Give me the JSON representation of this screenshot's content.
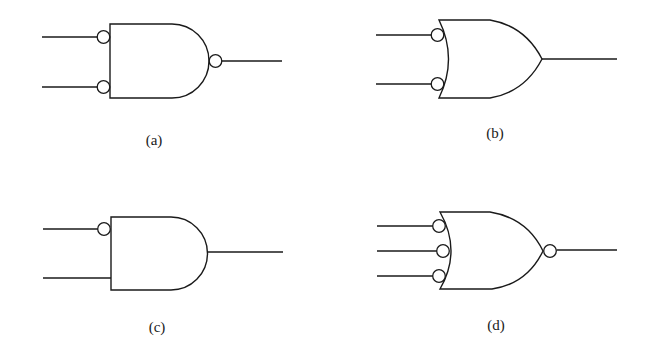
{
  "figure": {
    "background": "#ffffff",
    "stroke": "#1a1a1a",
    "gates": [
      {
        "id": "a",
        "label": "(a)",
        "type": "AND",
        "inputs": 2,
        "inverted_inputs": [
          true,
          true
        ],
        "inverted_output": true
      },
      {
        "id": "b",
        "label": "(b)",
        "type": "OR",
        "inputs": 2,
        "inverted_inputs": [
          true,
          true
        ],
        "inverted_output": false
      },
      {
        "id": "c",
        "label": "(c)",
        "type": "AND",
        "inputs": 2,
        "inverted_inputs": [
          true,
          false
        ],
        "inverted_output": false
      },
      {
        "id": "d",
        "label": "(d)",
        "type": "OR",
        "inputs": 3,
        "inverted_inputs": [
          true,
          true,
          true
        ],
        "inverted_output": true
      }
    ]
  }
}
